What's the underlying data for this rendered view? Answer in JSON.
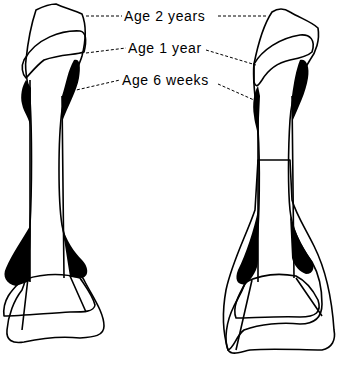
{
  "figure": {
    "type": "anatomical line drawing",
    "labels": [
      {
        "id": "age-2-years",
        "text": "Age 2 years",
        "style": "plain outline"
      },
      {
        "id": "age-1-year",
        "text": "Age 1 year",
        "style": "hatched"
      },
      {
        "id": "age-6-weeks",
        "text": "Age 6 weeks",
        "style": "solid black"
      }
    ],
    "panels": [
      {
        "id": "left-bone",
        "extra_layer": "none"
      },
      {
        "id": "right-bone",
        "extra_layer": "stippled region"
      }
    ],
    "colors": {
      "ink": "#000000",
      "background": "#ffffff"
    }
  }
}
